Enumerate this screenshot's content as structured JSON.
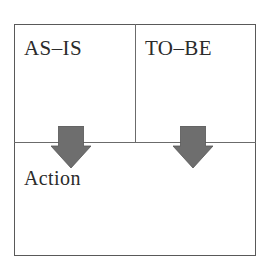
{
  "diagram": {
    "type": "matrix-frame",
    "title": "",
    "colors": {
      "background": "#ffffff",
      "frame_border": "#595959",
      "divider": "#6b6b6b",
      "text": "#2b2b2b",
      "arrow_fill": "#6e6e6e",
      "arrow_stroke": "#555555"
    },
    "cells": [
      {
        "id": "as-is",
        "label": "AS–IS",
        "column": 1,
        "row": 1
      },
      {
        "id": "to-be",
        "label": "TO–BE",
        "column": 2,
        "row": 1
      },
      {
        "id": "action",
        "label": "Action",
        "column": 1,
        "row": 2,
        "spans_full_width": true
      }
    ],
    "arrows": [
      {
        "id": "as-is-to-action",
        "icon": "down-arrow-icon",
        "from": "as-is",
        "to": "action",
        "direction": "down"
      },
      {
        "id": "to-be-to-action",
        "icon": "down-arrow-icon",
        "from": "to-be",
        "to": "action",
        "direction": "down"
      }
    ]
  }
}
